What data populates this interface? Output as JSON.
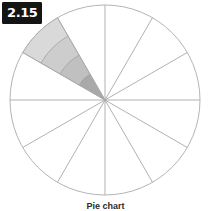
{
  "figure": {
    "index_label": "2.15",
    "caption": "Pie chart",
    "background_color": "#ffffff",
    "badge_background_color": "#141414",
    "badge_text_color": "#ffffff"
  },
  "chart_data": {
    "type": "pie",
    "title": "Pie chart",
    "subtitle": "",
    "xlabel": "",
    "ylabel": "",
    "grid": false,
    "legend_position": "none",
    "center_x": 105,
    "center_y": 100,
    "radius": 95,
    "slice_count": 12,
    "slice_angle_degrees": 30,
    "start_angle_degrees": -90,
    "categories": [
      "Slice 1",
      "Slice 2",
      "Slice 3",
      "Slice 4",
      "Slice 5",
      "Slice 6",
      "Slice 7",
      "Slice 8",
      "Slice 9",
      "Slice 10",
      "Slice 11",
      "Slice 12"
    ],
    "values": [
      8.3333,
      8.3333,
      8.3333,
      8.3333,
      8.3333,
      8.3333,
      8.3333,
      8.3333,
      8.3333,
      8.3333,
      8.3333,
      8.3333
    ],
    "outline_color": "#b4b4b4",
    "spoke_color": "#a8a8a8",
    "slice_fill_color": "#ffffff",
    "highlighted_slice_index": 7,
    "highlighted_slice_start_angle": 210,
    "highlighted_slice_end_angle": 240,
    "highlight_bands": [
      {
        "name": "band-1",
        "inner_radius": 0,
        "outer_radius": 30,
        "fill": "#a9a9a9"
      },
      {
        "name": "band-2",
        "inner_radius": 30,
        "outer_radius": 52,
        "fill": "#c0c0c0"
      },
      {
        "name": "band-3",
        "inner_radius": 52,
        "outer_radius": 74,
        "fill": "#cdcdcd"
      },
      {
        "name": "band-4",
        "inner_radius": 74,
        "outer_radius": 95,
        "fill": "#d9d9d9"
      }
    ],
    "band_edge_color": "#9a9a9a",
    "annotations": []
  }
}
